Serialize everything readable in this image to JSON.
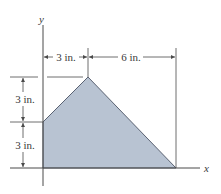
{
  "figure": {
    "axes": {
      "x_label": "x",
      "y_label": "y"
    },
    "shape": {
      "type": "quadrilateral",
      "fill_color": "#b8c3d2",
      "edge_color": "#5a6272",
      "vertices_in": [
        [
          0,
          0
        ],
        [
          0,
          3
        ],
        [
          3,
          6
        ],
        [
          9,
          0
        ]
      ]
    },
    "dimensions": {
      "top_left": "3 in.",
      "top_right": "6 in.",
      "left_upper": "3 in.",
      "left_lower": "3 in."
    },
    "colors": {
      "line": "#4a4a4a",
      "background": "#ffffff"
    }
  }
}
